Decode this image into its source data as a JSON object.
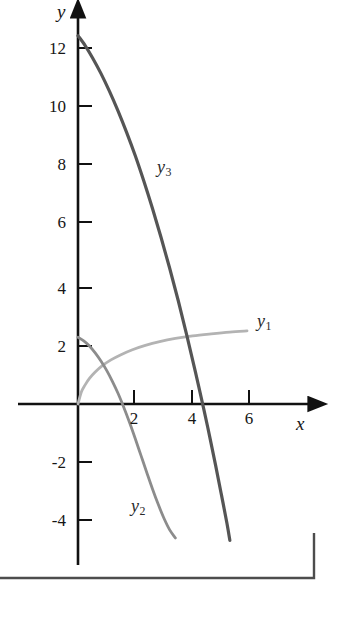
{
  "chart_data": {
    "type": "line",
    "title": "",
    "subtitle": "",
    "xlabel": "x",
    "ylabel": "y",
    "xlim": [
      -0.6,
      7.4
    ],
    "ylim": [
      -5.6,
      13.8
    ],
    "grid": false,
    "legend_position": "inline-curve-labels",
    "xticks": [
      2,
      4,
      6
    ],
    "xtick_labels": [
      "2",
      "4",
      "6"
    ],
    "yticks": [
      -4,
      -2,
      2,
      4,
      6,
      8,
      10,
      12
    ],
    "ytick_labels": [
      "-4",
      "-2",
      "2",
      "4",
      "6",
      "8",
      "10",
      "12"
    ],
    "annotations": [
      {
        "text": "y_3",
        "label": "y",
        "sub": "3",
        "x": 3.0,
        "y": 7.6
      },
      {
        "text": "y_1",
        "label": "y",
        "sub": "1",
        "x": 6.3,
        "y": 2.9
      },
      {
        "text": "y_2",
        "label": "y",
        "sub": "2",
        "x": 2.2,
        "y": -3.6
      }
    ],
    "series": [
      {
        "name": "y1",
        "label": "y",
        "sub": "1",
        "color": "#b3b3b3",
        "description": "increasing concave-down curve from origin",
        "points": [
          [
            0.0,
            0.0
          ],
          [
            0.12,
            0.42
          ],
          [
            0.25,
            0.66
          ],
          [
            0.4,
            0.88
          ],
          [
            0.6,
            1.1
          ],
          [
            0.85,
            1.32
          ],
          [
            1.15,
            1.52
          ],
          [
            1.5,
            1.7
          ],
          [
            1.9,
            1.87
          ],
          [
            2.35,
            2.02
          ],
          [
            2.85,
            2.15
          ],
          [
            3.4,
            2.26
          ],
          [
            4.0,
            2.35
          ],
          [
            4.65,
            2.42
          ],
          [
            5.3,
            2.48
          ],
          [
            5.9,
            2.52
          ]
        ]
      },
      {
        "name": "y2",
        "label": "y",
        "sub": "2",
        "color": "#8c8c8c",
        "description": "downward-opening parabola starting near y=2.3",
        "points": [
          [
            0.0,
            2.3
          ],
          [
            0.2,
            2.18
          ],
          [
            0.4,
            2.0
          ],
          [
            0.6,
            1.76
          ],
          [
            0.8,
            1.48
          ],
          [
            1.0,
            1.16
          ],
          [
            1.2,
            0.78
          ],
          [
            1.4,
            0.36
          ],
          [
            1.6,
            -0.12
          ],
          [
            1.8,
            -0.64
          ],
          [
            2.0,
            -1.2
          ],
          [
            2.2,
            -1.78
          ],
          [
            2.4,
            -2.36
          ],
          [
            2.6,
            -2.93
          ],
          [
            2.8,
            -3.46
          ],
          [
            3.0,
            -3.94
          ],
          [
            3.2,
            -4.34
          ],
          [
            3.4,
            -4.62
          ]
        ]
      },
      {
        "name": "y3",
        "label": "y",
        "sub": "3",
        "color": "#555555",
        "description": "steep downward-opening parabola starting near y=12.7",
        "points": [
          [
            0.0,
            12.7
          ],
          [
            0.25,
            12.36
          ],
          [
            0.5,
            11.95
          ],
          [
            0.8,
            11.4
          ],
          [
            1.1,
            10.78
          ],
          [
            1.4,
            10.1
          ],
          [
            1.7,
            9.36
          ],
          [
            2.0,
            8.56
          ],
          [
            2.3,
            7.68
          ],
          [
            2.6,
            6.74
          ],
          [
            2.9,
            5.74
          ],
          [
            3.2,
            4.68
          ],
          [
            3.5,
            3.56
          ],
          [
            3.8,
            2.36
          ],
          [
            4.1,
            1.1
          ],
          [
            4.4,
            -0.22
          ],
          [
            4.6,
            -1.14
          ],
          [
            4.8,
            -2.1
          ],
          [
            5.0,
            -3.1
          ],
          [
            5.2,
            -4.12
          ],
          [
            5.3,
            -4.7
          ]
        ]
      }
    ]
  },
  "axes": {
    "x_axis_name": "x",
    "y_axis_name": "y"
  },
  "figure_border": {
    "present": true,
    "description": "page rule along bottom with right upturn"
  }
}
